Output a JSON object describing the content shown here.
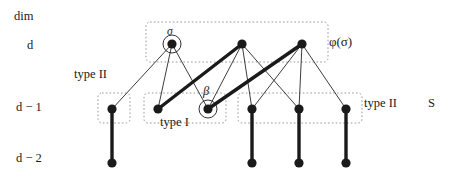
{
  "figure": {
    "width": 460,
    "height": 181,
    "background": "#ffffff",
    "ink": "#1a1a1a",
    "dashed_box_color": "#9a9a9a"
  },
  "axis_labels": {
    "title": "dim",
    "level_d": "d",
    "level_d_minus_1": "d − 1",
    "level_d_minus_2": "d − 2"
  },
  "annotations": {
    "type_two_left": "type II",
    "type_one": "type I",
    "type_two_right": "type II",
    "set_S": "S",
    "phi_sigma": "φ(σ)",
    "sigma": "σ",
    "beta": "β"
  },
  "graph_data": {
    "type": "diagram",
    "levels": [
      {
        "name": "d",
        "y": 44
      },
      {
        "name": "d − 1",
        "y": 109
      },
      {
        "name": "d − 2",
        "y": 163
      }
    ],
    "nodes": [
      {
        "id": "t1",
        "label": "σ",
        "x": 172,
        "y": 44,
        "level": "d",
        "circled": true,
        "radius": 4.6
      },
      {
        "id": "t2",
        "label": "",
        "x": 242,
        "y": 44,
        "level": "d",
        "circled": false,
        "radius": 4.6
      },
      {
        "id": "t3",
        "label": "",
        "x": 302,
        "y": 44,
        "level": "d",
        "circled": false,
        "radius": 4.6
      },
      {
        "id": "m1",
        "label": "",
        "x": 112,
        "y": 109,
        "level": "d − 1",
        "circled": false,
        "radius": 4.6
      },
      {
        "id": "m2",
        "label": "",
        "x": 158,
        "y": 109,
        "level": "d − 1",
        "circled": false,
        "radius": 4.6
      },
      {
        "id": "m3",
        "label": "β",
        "x": 208,
        "y": 109,
        "level": "d − 1",
        "circled": true,
        "radius": 4.6
      },
      {
        "id": "m4",
        "label": "",
        "x": 252,
        "y": 109,
        "level": "d − 1",
        "circled": false,
        "radius": 4.6
      },
      {
        "id": "m5",
        "label": "",
        "x": 299,
        "y": 109,
        "level": "d − 1",
        "circled": false,
        "radius": 4.6
      },
      {
        "id": "m6",
        "label": "",
        "x": 346,
        "y": 109,
        "level": "d − 1",
        "circled": false,
        "radius": 4.6
      },
      {
        "id": "b1",
        "label": "",
        "x": 112,
        "y": 163,
        "level": "d − 2",
        "circled": false,
        "radius": 4.6
      },
      {
        "id": "b2",
        "label": "",
        "x": 252,
        "y": 163,
        "level": "d − 2",
        "circled": false,
        "radius": 4.6
      },
      {
        "id": "b3",
        "label": "",
        "x": 299,
        "y": 163,
        "level": "d − 2",
        "circled": false,
        "radius": 4.6
      },
      {
        "id": "b4",
        "label": "",
        "x": 346,
        "y": 163,
        "level": "d − 2",
        "circled": false,
        "radius": 4.6
      }
    ],
    "edges": [
      {
        "from": "t1",
        "to": "m1",
        "weight": "thin"
      },
      {
        "from": "t1",
        "to": "m2",
        "weight": "thin"
      },
      {
        "from": "t1",
        "to": "m3",
        "weight": "thin"
      },
      {
        "from": "t2",
        "to": "m2",
        "weight": "thick"
      },
      {
        "from": "t2",
        "to": "m3",
        "weight": "thin"
      },
      {
        "from": "t2",
        "to": "m4",
        "weight": "thin"
      },
      {
        "from": "t2",
        "to": "m5",
        "weight": "thin"
      },
      {
        "from": "t3",
        "to": "m3",
        "weight": "thick"
      },
      {
        "from": "t3",
        "to": "m4",
        "weight": "thin"
      },
      {
        "from": "t3",
        "to": "m5",
        "weight": "thin"
      },
      {
        "from": "t3",
        "to": "m6",
        "weight": "thin"
      },
      {
        "from": "m1",
        "to": "b1",
        "weight": "thick"
      },
      {
        "from": "m4",
        "to": "b2",
        "weight": "thick"
      },
      {
        "from": "m5",
        "to": "b3",
        "weight": "thick"
      },
      {
        "from": "m6",
        "to": "b4",
        "weight": "thick"
      }
    ],
    "dashed_boxes": [
      {
        "id": "box-top",
        "x": 146,
        "y": 22,
        "w": 182,
        "h": 40
      },
      {
        "id": "box-type-II-l",
        "x": 98,
        "y": 93,
        "w": 32,
        "h": 30
      },
      {
        "id": "box-type-I",
        "x": 144,
        "y": 93,
        "w": 82,
        "h": 30
      },
      {
        "id": "box-type-II-r",
        "x": 238,
        "y": 93,
        "w": 124,
        "h": 30
      }
    ]
  }
}
